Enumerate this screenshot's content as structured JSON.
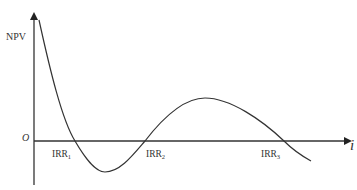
{
  "diagram": {
    "y_axis_label": "NPV",
    "x_axis_label": "i",
    "origin_label": "O",
    "roots": [
      {
        "base": "IRR",
        "sub": "1"
      },
      {
        "base": "IRR",
        "sub": "2"
      },
      {
        "base": "IRR",
        "sub": "3"
      }
    ],
    "colors": {
      "line": "#333333",
      "text": "#333333",
      "background": "#ffffff"
    }
  }
}
